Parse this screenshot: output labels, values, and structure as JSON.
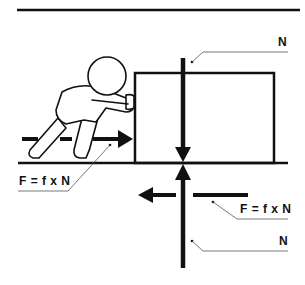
{
  "diagram": {
    "title": "",
    "type": "friction force diagram",
    "colors": {
      "stroke": "#111111",
      "background": "#ffffff",
      "leader": "#555555"
    },
    "labels": {
      "normal_top": "N",
      "friction_left": "F = f x N",
      "friction_right": "F = f x N",
      "normal_bottom": "N"
    },
    "elements": [
      {
        "name": "top-rule",
        "kind": "line"
      },
      {
        "name": "person-pushing",
        "kind": "figure"
      },
      {
        "name": "box",
        "kind": "rectangle"
      },
      {
        "name": "ground",
        "kind": "line"
      },
      {
        "name": "push-force-arrow",
        "kind": "arrow",
        "direction": "right",
        "label": "F = f x N"
      },
      {
        "name": "normal-force-down-arrow",
        "kind": "arrow",
        "direction": "down",
        "label": "N"
      },
      {
        "name": "normal-force-up-arrow",
        "kind": "arrow",
        "direction": "up",
        "label": "N"
      },
      {
        "name": "friction-force-arrow",
        "kind": "arrow",
        "direction": "left",
        "label": "F = f x N"
      }
    ]
  }
}
